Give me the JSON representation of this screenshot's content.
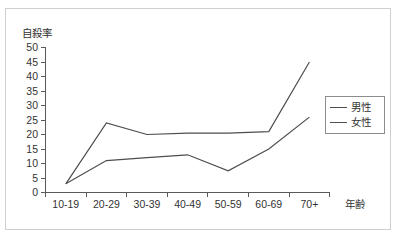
{
  "chart_data": {
    "type": "line",
    "title": "",
    "ylabel": "自殺率",
    "xlabel": "年齢",
    "categories": [
      "10-19",
      "20-29",
      "30-39",
      "40-49",
      "50-59",
      "60-69",
      "70+"
    ],
    "ylim": [
      0,
      50
    ],
    "yticks": [
      0,
      5,
      10,
      15,
      20,
      25,
      30,
      35,
      40,
      45,
      50
    ],
    "grid": false,
    "legend_position": "right",
    "series": [
      {
        "name": "男性",
        "values": [
          3,
          24,
          20,
          20.5,
          20.5,
          21,
          45
        ],
        "color": "#4d4d4d"
      },
      {
        "name": "女性",
        "values": [
          3,
          11,
          12,
          13,
          7.5,
          15,
          26
        ],
        "color": "#4d4d4d"
      }
    ]
  },
  "axes": {
    "y_title": "自殺率",
    "x_title": "年齢",
    "y_tick_labels": [
      "50",
      "45",
      "40",
      "35",
      "30",
      "25",
      "20",
      "15",
      "10",
      "5",
      "0"
    ],
    "x_tick_labels": [
      "10-19",
      "20-29",
      "30-39",
      "40-49",
      "50-59",
      "60-69",
      "70+"
    ]
  },
  "legend": {
    "items": [
      {
        "label": "男性"
      },
      {
        "label": "女性"
      }
    ]
  }
}
